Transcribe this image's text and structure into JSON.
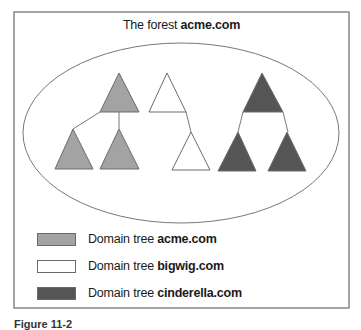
{
  "figure": {
    "title_prefix": "The forest ",
    "title_domain": "acme.com",
    "caption": "Figure 11-2"
  },
  "colors": {
    "acme": "#a3a3a3",
    "bigwig": "#ffffff",
    "cinderella": "#555555",
    "outline": "#6a6a6a"
  },
  "trees": [
    {
      "name": "acme.com",
      "fill": "#a3a3a3",
      "nodes": [
        {
          "role": "root",
          "apex": [
            119,
            73
          ],
          "base": [
            [
              100,
              112
            ],
            [
              139,
              112
            ]
          ]
        },
        {
          "role": "child-left",
          "apex": [
            73,
            129
          ],
          "base": [
            [
              55,
              169
            ],
            [
              93,
              169
            ]
          ]
        },
        {
          "role": "child-right",
          "apex": [
            119,
            129
          ],
          "base": [
            [
              100,
              169
            ],
            [
              139,
              169
            ]
          ]
        }
      ]
    },
    {
      "name": "bigwig.com",
      "fill": "#ffffff",
      "nodes": [
        {
          "role": "root",
          "apex": [
            167,
            73
          ],
          "base": [
            [
              149,
              112
            ],
            [
              186,
              112
            ]
          ]
        },
        {
          "role": "child",
          "apex": [
            191,
            132
          ],
          "base": [
            [
              172,
              170
            ],
            [
              210,
              170
            ]
          ]
        }
      ]
    },
    {
      "name": "cinderella.com",
      "fill": "#555555",
      "nodes": [
        {
          "role": "root",
          "apex": [
            262,
            73
          ],
          "base": [
            [
              243,
              112
            ],
            [
              283,
              112
            ]
          ]
        },
        {
          "role": "child-left",
          "apex": [
            238,
            132
          ],
          "base": [
            [
              218,
              171
            ],
            [
              256,
              171
            ]
          ]
        },
        {
          "role": "child-right",
          "apex": [
            287,
            132
          ],
          "base": [
            [
              268,
              171
            ],
            [
              306,
              171
            ]
          ]
        }
      ]
    }
  ],
  "legend": [
    {
      "prefix": "Domain tree ",
      "domain": "acme.com",
      "color": "#a3a3a3"
    },
    {
      "prefix": "Domain tree ",
      "domain": "bigwig.com",
      "color": "#ffffff"
    },
    {
      "prefix": "Domain tree ",
      "domain": "cinderella.com",
      "color": "#555555"
    }
  ]
}
